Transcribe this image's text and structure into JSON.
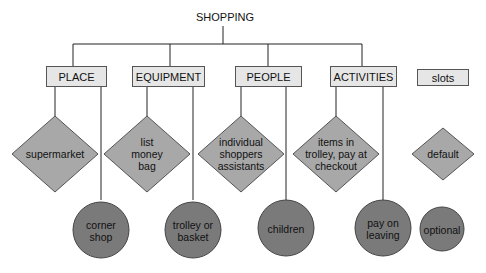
{
  "diagram": {
    "root": "SHOPPING",
    "frames": [
      {
        "label": "PLACE",
        "default": "supermarket",
        "optional": "corner\nshop"
      },
      {
        "label": "EQUIPMENT",
        "default": "list\nmoney\nbag",
        "optional": "trolley or\nbasket"
      },
      {
        "label": "PEOPLE",
        "default": "individual\nshoppers\nassistants",
        "optional": "children"
      },
      {
        "label": "ACTIVITIES",
        "default": "items in\ntrolley, pay at\ncheckout",
        "optional": "pay on\nleaving"
      }
    ],
    "legend": {
      "slots": "slots",
      "default": "default",
      "optional": "optional"
    }
  },
  "colors": {
    "box_fill": "#e6e6e6",
    "diamond_fill": "#a8a8a8",
    "circle_fill": "#7a7a7a",
    "line": "#222222"
  }
}
